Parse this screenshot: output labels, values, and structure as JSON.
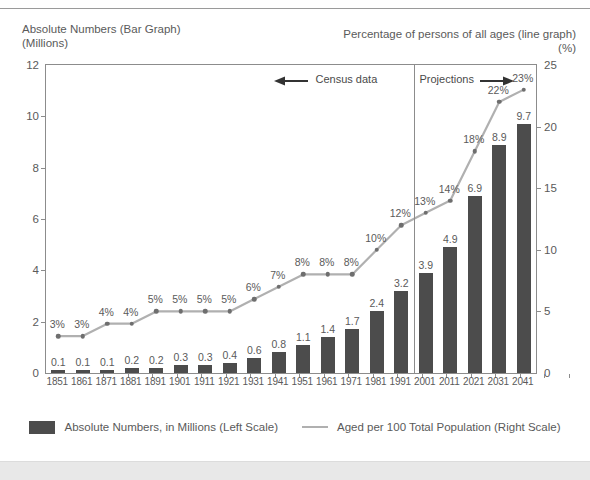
{
  "header": {
    "title_left": "Absolute Numbers (Bar Graph)\n(Millions)",
    "title_right": "Percentage of persons of all ages (line graph)",
    "title_right_unit": "(%)"
  },
  "annotations": {
    "census": "Census data",
    "projections": "Projections"
  },
  "legend": {
    "bar_label": "Absolute Numbers, in Millions (Left Scale)",
    "line_label": "Aged per 100 Total Population (Right Scale)"
  },
  "colors": {
    "bar": "#4c4c4c",
    "line": "#b0b0b0",
    "marker": "#6e6e6e",
    "axis": "#8c8c8c",
    "text": "#5a5a5a"
  },
  "chart_data": {
    "type": "bar",
    "title": "Absolute Numbers (Bar Graph) (Millions)",
    "xlabel": "",
    "ylabel": "Millions",
    "y2label": "%",
    "ylim": [
      0,
      12
    ],
    "y2lim": [
      0,
      25
    ],
    "yticks": [
      0,
      2,
      4,
      6,
      8,
      10,
      12
    ],
    "y2ticks": [
      0,
      5,
      10,
      15,
      20,
      25
    ],
    "grid": false,
    "legend_position": "bottom",
    "categories": [
      "1851",
      "1861",
      "1871",
      "1881",
      "1891",
      "1901",
      "1911",
      "1921",
      "1931",
      "1941",
      "1951",
      "1961",
      "1971",
      "1981",
      "1991",
      "2001",
      "2011",
      "2021",
      "2031",
      "2041"
    ],
    "series": [
      {
        "name": "Absolute Numbers, in Millions (Left Scale)",
        "type": "bar",
        "axis": "left",
        "values": [
          0.1,
          0.1,
          0.1,
          0.2,
          0.2,
          0.3,
          0.3,
          0.4,
          0.6,
          0.8,
          1.1,
          1.4,
          1.7,
          2.4,
          3.2,
          3.9,
          4.9,
          6.9,
          8.9,
          9.7
        ],
        "labels": [
          "0.1",
          "0.1",
          "0.1",
          "0.2",
          "0.2",
          "0.3",
          "0.3",
          "0.4",
          "0.6",
          "0.8",
          "1.1",
          "1.4",
          "1.7",
          "2.4",
          "3.2",
          "3.9",
          "4.9",
          "6.9",
          "8.9",
          "9.7"
        ]
      },
      {
        "name": "Aged per 100 Total Population (Right Scale)",
        "type": "line",
        "axis": "right",
        "values": [
          3,
          3,
          4,
          4,
          5,
          5,
          5,
          5,
          6,
          7,
          8,
          8,
          8,
          10,
          12,
          13,
          14,
          18,
          22,
          23
        ],
        "labels": [
          "3%",
          "3%",
          "4%",
          "4%",
          "5%",
          "5%",
          "5%",
          "5%",
          "6%",
          "7%",
          "8%",
          "8%",
          "8%",
          "10%",
          "12%",
          "13%",
          "14%",
          "18%",
          "22%",
          "23%"
        ]
      }
    ],
    "divider_at": "2001",
    "annotations": [
      "Census data",
      "Projections"
    ]
  }
}
